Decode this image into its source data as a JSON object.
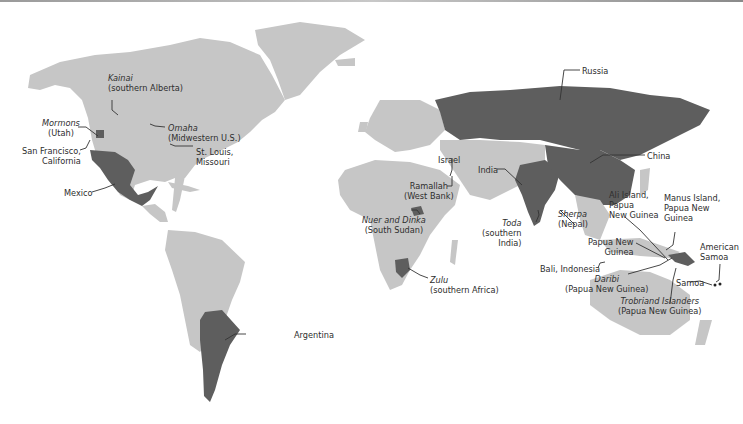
{
  "map": {
    "type": "world-map",
    "style": "grayscale choropleth with callout labels",
    "colors": {
      "land": "#c6c6c6",
      "highlighted": "#5e5e5e",
      "ocean": "#ffffff",
      "label_text": "#2e2e2e",
      "leader_line": "#333333"
    },
    "highlighted_countries": [
      "Russia",
      "China",
      "India",
      "Mexico",
      "Argentina"
    ],
    "labels": {
      "kainai": {
        "group": "Kainai",
        "place": "(southern Alberta)",
        "italic_group": true
      },
      "mormons": {
        "group": "Mormons",
        "place": "(Utah)",
        "italic_group": true
      },
      "omaha": {
        "group": "Omaha",
        "place": "(Midwestern U.S.)",
        "italic_group": true
      },
      "sanfran": {
        "line1": "San Francisco,",
        "line2": "California"
      },
      "stlouis": {
        "line1": "St. Louis,",
        "line2": "Missouri"
      },
      "mexico": {
        "text": "Mexico"
      },
      "argentina": {
        "text": "Argentina"
      },
      "russia": {
        "text": "Russia"
      },
      "china": {
        "text": "China"
      },
      "israel": {
        "text": "Israel"
      },
      "ramallah": {
        "line1": "Ramallah",
        "line2": "(West Bank)"
      },
      "india": {
        "text": "India"
      },
      "nuer": {
        "line1": "Nuer and Dinka",
        "line2": "(South Sudan)",
        "italic_group": true
      },
      "toda": {
        "group": "Toda",
        "line2": "(southern",
        "line3": "India)",
        "italic_group": true
      },
      "sherpa": {
        "group": "Sherpa",
        "place": "(Nepal)",
        "italic_group": true
      },
      "zulu": {
        "group": "Zulu",
        "place": "(southern Africa)",
        "italic_group": true
      },
      "ali": {
        "line1": "Ali Island,",
        "line2": "Papua",
        "line3": "New Guinea"
      },
      "manus": {
        "line1": "Manus Island,",
        "line2": "Papua New",
        "line3": "Guinea"
      },
      "png": {
        "line1": "Papua New",
        "line2": "Guinea"
      },
      "bali": {
        "text": "Bali, Indonesia"
      },
      "daribi": {
        "group": "Daribi",
        "place": "(Papua New Guinea)",
        "italic_group": true
      },
      "trobriand": {
        "group": "Trobriand Islanders",
        "place": "(Papua New Guinea)",
        "italic_group": true
      },
      "amsamoa": {
        "line1": "American",
        "line2": "Samoa"
      },
      "samoa": {
        "text": "Samoa"
      }
    }
  }
}
